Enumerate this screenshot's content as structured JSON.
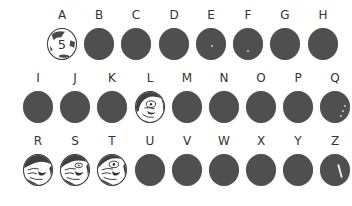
{
  "grid": {
    "rows": [
      {
        "items": [
          {
            "letter": "A",
            "state": "revealed-number",
            "value": "5"
          },
          {
            "letter": "B",
            "state": "covered"
          },
          {
            "letter": "C",
            "state": "covered"
          },
          {
            "letter": "D",
            "state": "covered"
          },
          {
            "letter": "E",
            "state": "covered"
          },
          {
            "letter": "F",
            "state": "covered"
          },
          {
            "letter": "G",
            "state": "covered"
          },
          {
            "letter": "H",
            "state": "covered"
          }
        ]
      },
      {
        "items": [
          {
            "letter": "I",
            "state": "covered"
          },
          {
            "letter": "J",
            "state": "covered"
          },
          {
            "letter": "K",
            "state": "covered"
          },
          {
            "letter": "L",
            "state": "revealed-face"
          },
          {
            "letter": "M",
            "state": "covered"
          },
          {
            "letter": "N",
            "state": "covered"
          },
          {
            "letter": "O",
            "state": "covered"
          },
          {
            "letter": "P",
            "state": "covered"
          },
          {
            "letter": "Q",
            "state": "partially-scratched"
          }
        ]
      },
      {
        "items": [
          {
            "letter": "R",
            "state": "revealed-face"
          },
          {
            "letter": "S",
            "state": "revealed-face"
          },
          {
            "letter": "T",
            "state": "revealed-face"
          },
          {
            "letter": "U",
            "state": "covered"
          },
          {
            "letter": "V",
            "state": "covered"
          },
          {
            "letter": "W",
            "state": "covered"
          },
          {
            "letter": "X",
            "state": "covered"
          },
          {
            "letter": "Y",
            "state": "covered"
          },
          {
            "letter": "Z",
            "state": "partially-scratched"
          }
        ]
      }
    ]
  },
  "colors": {
    "cover": "#4f4f4f",
    "label": "#333333",
    "background": "#ffffff"
  }
}
